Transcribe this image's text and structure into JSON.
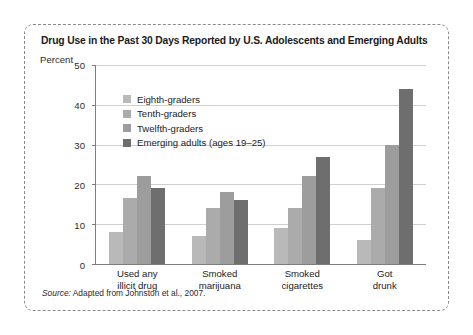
{
  "figure": {
    "title": "Drug Use in the Past 30 Days Reported by U.S. Adolescents and Emerging Adults",
    "source_label": "Source:",
    "source_text": " Adapted from Johnston et al., 2007."
  },
  "chart_data": {
    "type": "bar",
    "title": "Drug Use in the Past 30 Days Reported by U.S. Adolescents and Emerging Adults",
    "xlabel": "",
    "ylabel": "Percent",
    "ylim": [
      0,
      50
    ],
    "yticks": [
      0,
      10,
      20,
      30,
      40,
      50
    ],
    "grid": true,
    "legend_position": "upper-left-inside",
    "categories": [
      [
        "Used any",
        "illicit drug"
      ],
      [
        "Smoked",
        "marijuana"
      ],
      [
        "Smoked",
        "cigarettes"
      ],
      [
        "Got",
        "drunk"
      ]
    ],
    "series": [
      {
        "name": "Eighth-graders",
        "color": "#b9b9b9",
        "values": [
          8,
          7,
          9,
          6
        ]
      },
      {
        "name": "Tenth-graders",
        "color": "#ababab",
        "values": [
          16.5,
          14,
          14,
          19
        ]
      },
      {
        "name": "Twelfth-graders",
        "color": "#9d9d9d",
        "values": [
          22,
          18,
          22,
          30
        ]
      },
      {
        "name": "Emerging adults (ages 19–25)",
        "color": "#6e6e6e",
        "values": [
          19,
          16,
          27,
          44
        ]
      }
    ]
  }
}
